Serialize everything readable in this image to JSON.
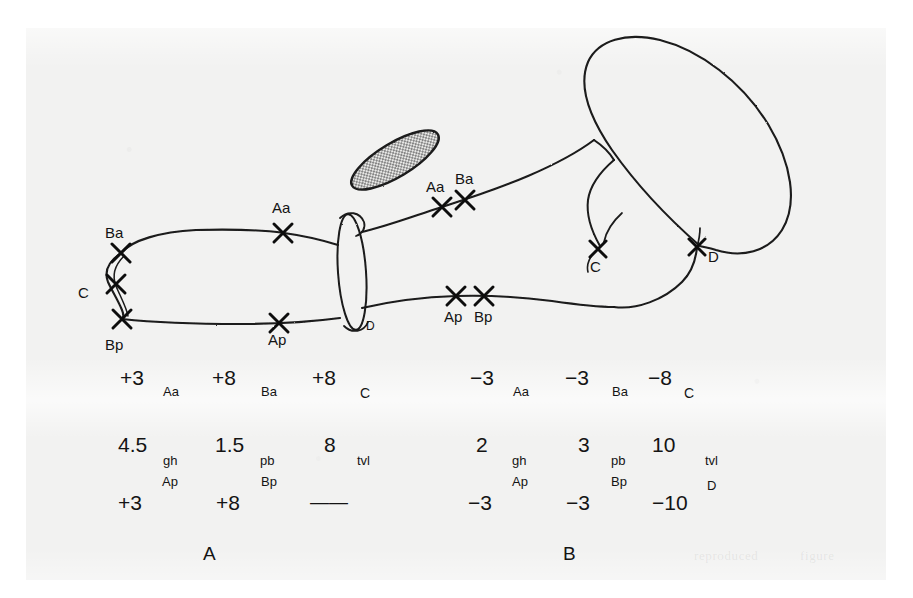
{
  "figure": {
    "kind": "hand-drawn scientific diagram with two data tables",
    "diagram_labels": [
      {
        "text": "Ba",
        "x": 118,
        "y": 243,
        "pos": "above-left"
      },
      {
        "text": "C",
        "x": 88,
        "y": 292,
        "pos": "left"
      },
      {
        "text": "Bp",
        "x": 118,
        "y": 342,
        "pos": "below-left"
      },
      {
        "text": "Aa",
        "x": 283,
        "y": 208,
        "pos": "above"
      },
      {
        "text": "Ap",
        "x": 279,
        "y": 337,
        "pos": "below"
      },
      {
        "text": "Aa",
        "x": 440,
        "y": 190,
        "pos": "above"
      },
      {
        "text": "Ba",
        "x": 467,
        "y": 182,
        "pos": "above"
      },
      {
        "text": "Ap",
        "x": 456,
        "y": 312,
        "pos": "below"
      },
      {
        "text": "Bp",
        "x": 487,
        "y": 312,
        "pos": "below"
      },
      {
        "text": "C",
        "x": 597,
        "y": 264,
        "pos": "below"
      },
      {
        "text": "D",
        "x": 703,
        "y": 256,
        "pos": "right"
      },
      {
        "text": "D",
        "x": 371,
        "y": 322,
        "pos": "right"
      }
    ],
    "cross_markers": [
      {
        "label": "Ba",
        "x": 121,
        "y": 253
      },
      {
        "label": "C",
        "x": 116,
        "y": 284
      },
      {
        "label": "Bp",
        "x": 122,
        "y": 319
      },
      {
        "label": "Aa",
        "x": 283,
        "y": 233
      },
      {
        "label": "Ap",
        "x": 279,
        "y": 323
      },
      {
        "label": "Aa",
        "x": 442,
        "y": 207
      },
      {
        "label": "Ba",
        "x": 465,
        "y": 200
      },
      {
        "label": "Ap",
        "x": 456,
        "y": 296
      },
      {
        "label": "Bp",
        "x": 484,
        "y": 296
      },
      {
        "label": "C",
        "x": 598,
        "y": 249
      },
      {
        "label": "D",
        "x": 697,
        "y": 247
      }
    ],
    "captions": [
      {
        "text": "A",
        "x": 210,
        "y": 552
      },
      {
        "text": "B",
        "x": 570,
        "y": 552
      }
    ]
  },
  "tables": [
    {
      "name": "A",
      "caption": "A",
      "rows": [
        [
          {
            "value": "+3",
            "sub": "Aa"
          },
          {
            "value": "+8",
            "sub": "Ba"
          },
          {
            "value": "+8",
            "sub": "C"
          }
        ],
        [
          {
            "value": "4.5",
            "sub": "gh"
          },
          {
            "value": "1.5",
            "sub": "pb"
          },
          {
            "value": "8",
            "sub": "tvl"
          }
        ],
        [
          {
            "value": "+3",
            "sub": "Ap"
          },
          {
            "value": "+8",
            "sub": "Bp"
          },
          {
            "value": "——",
            "sub": ""
          }
        ]
      ]
    },
    {
      "name": "B",
      "caption": "B",
      "rows": [
        [
          {
            "value": "−3",
            "sub": "Aa"
          },
          {
            "value": "−3",
            "sub": "Ba"
          },
          {
            "value": "−8",
            "sub": "C"
          }
        ],
        [
          {
            "value": "2",
            "sub": "gh"
          },
          {
            "value": "3",
            "sub": "pb"
          },
          {
            "value": "10",
            "sub": "tvl"
          }
        ],
        [
          {
            "value": "−3",
            "sub": "Ap"
          },
          {
            "value": "−3",
            "sub": "Bp"
          },
          {
            "value": "−10",
            "sub": "D"
          }
        ]
      ]
    }
  ],
  "bleed_text": [
    {
      "text": "reproduced",
      "x": 700,
      "y": 556
    },
    {
      "text": "figure",
      "x": 806,
      "y": 556
    }
  ],
  "colors": {
    "ink": "#1a1a1a",
    "paper": "#f2f2f1",
    "shade_fill": "#9a9a9a",
    "page": "#ffffff"
  }
}
